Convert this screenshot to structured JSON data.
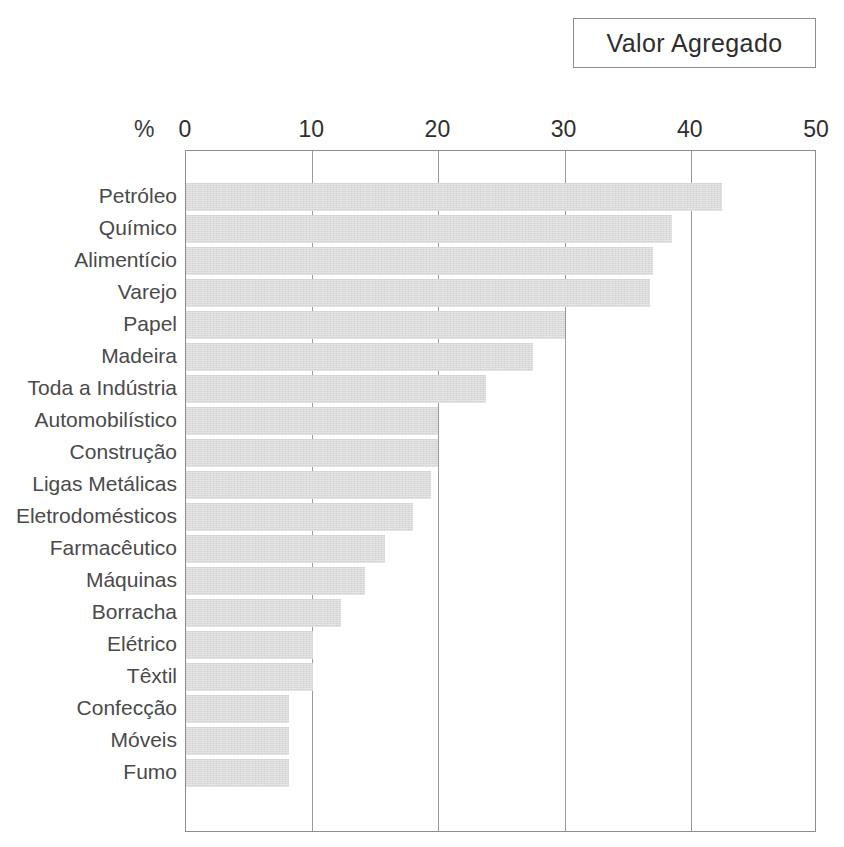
{
  "title": {
    "label": "Valor Agregado"
  },
  "axis": {
    "unit_label": "%",
    "tick_labels": [
      "0",
      "10",
      "20",
      "30",
      "40",
      "50"
    ]
  },
  "chart_data": {
    "type": "bar",
    "orientation": "horizontal",
    "title": "Valor Agregado",
    "xlabel": "%",
    "ylabel": "",
    "xlim": [
      0,
      50
    ],
    "xticks": [
      0,
      10,
      20,
      30,
      40,
      50
    ],
    "grid": true,
    "legend": "none",
    "bar_color": "#d9d9d9",
    "categories": [
      "Petróleo",
      "Químico",
      "Alimentício",
      "Varejo",
      "Papel",
      "Madeira",
      "Toda a Indústria",
      "Automobilístico",
      "Construção",
      "Ligas Metálicas",
      "Eletrodomésticos",
      "Farmacêutico",
      "Máquinas",
      "Borracha",
      "Elétrico",
      "Têxtil",
      "Confecção",
      "Móveis",
      "Fumo"
    ],
    "values": [
      42.5,
      38.5,
      37.0,
      36.8,
      30.0,
      27.5,
      23.8,
      20.0,
      20.0,
      19.4,
      18.0,
      15.8,
      14.2,
      12.3,
      10.1,
      10.1,
      8.2,
      8.2,
      8.2
    ]
  }
}
